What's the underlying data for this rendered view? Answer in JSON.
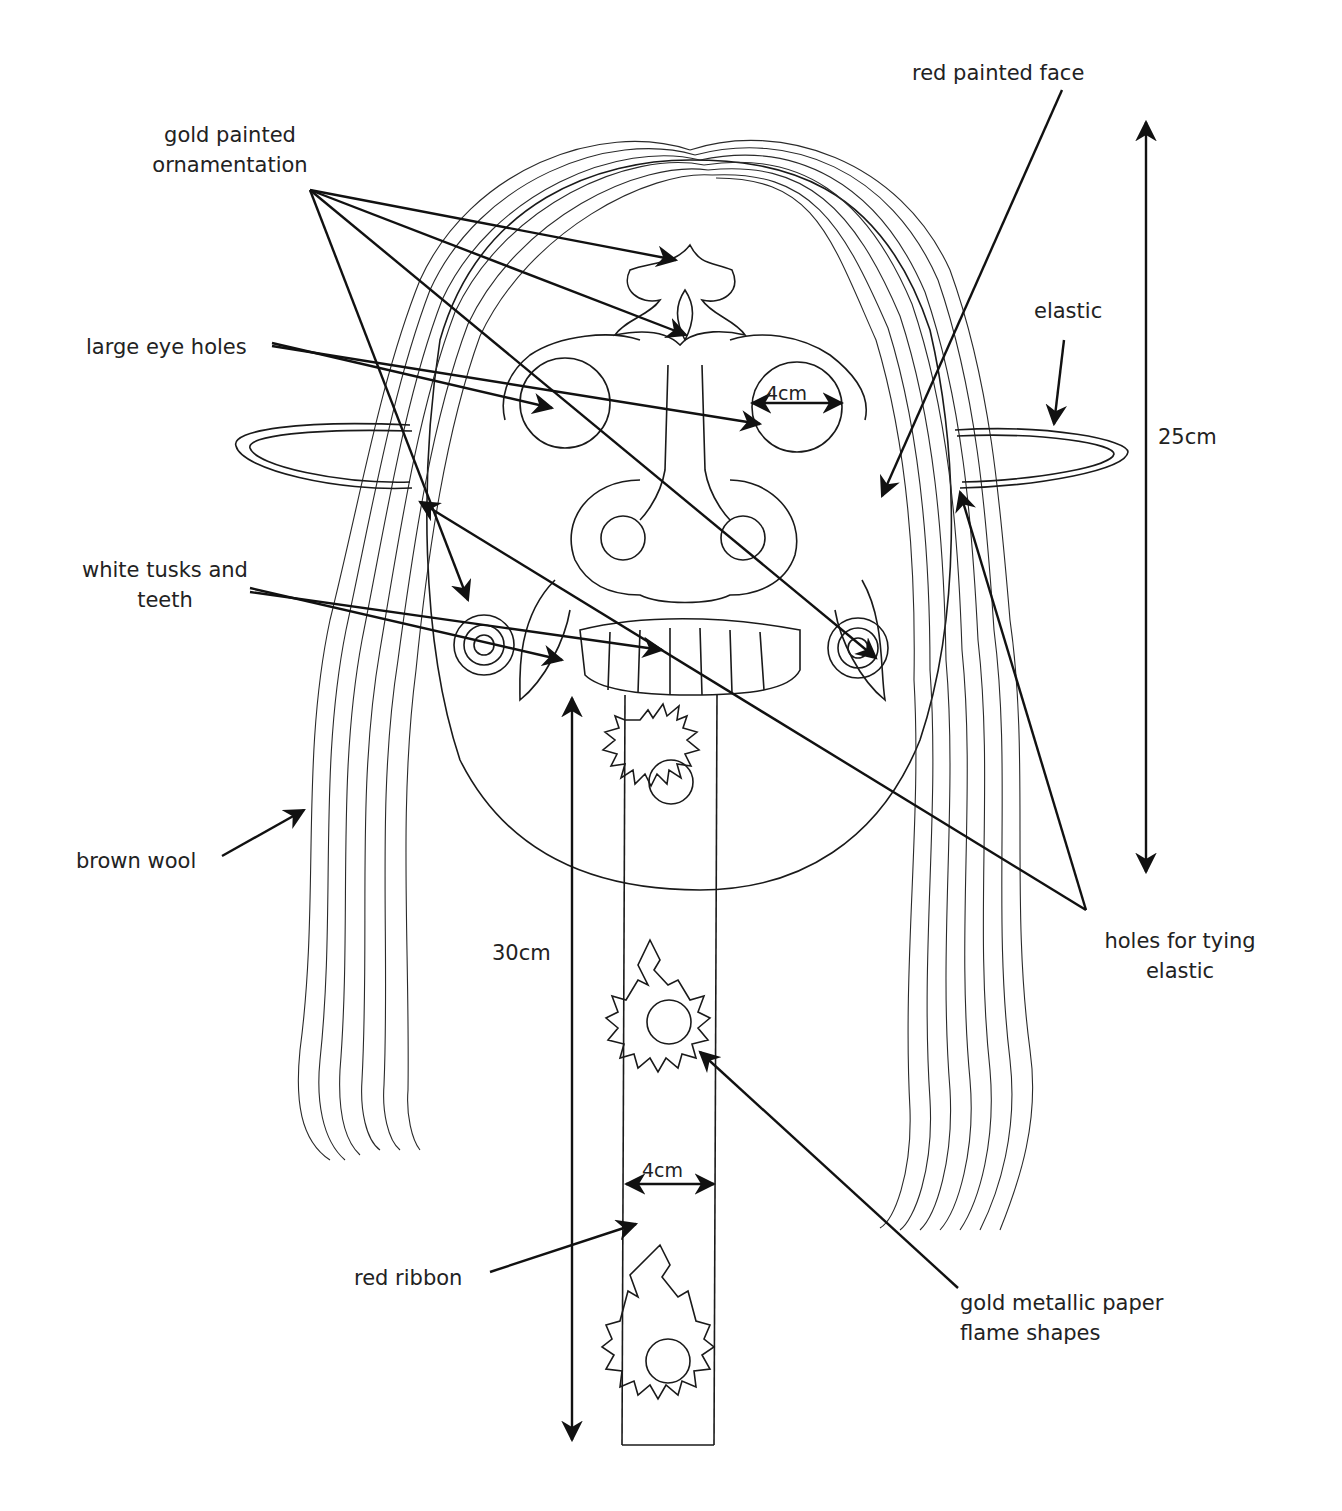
{
  "diagram": {
    "colors": {
      "ink": "#1a1a1a",
      "background": "#ffffff",
      "text": "#222222"
    },
    "labels": {
      "gold_ornamentation_line1": "gold painted",
      "gold_ornamentation_line2": "ornamentation",
      "red_face": "red painted face",
      "elastic": "elastic",
      "eye_holes": "large eye holes",
      "tusks_line1": "white tusks and",
      "tusks_line2": "teeth",
      "brown_wool": "brown wool",
      "tying_holes_line1": "holes for tying",
      "tying_holes_line2": "elastic",
      "red_ribbon": "red ribbon",
      "flames_line1": "gold metallic paper",
      "flames_line2": "flame shapes"
    },
    "dimensions": {
      "face_height": "25cm",
      "ribbon_length": "30cm",
      "eye_width": "4cm",
      "ribbon_width": "4cm"
    }
  }
}
